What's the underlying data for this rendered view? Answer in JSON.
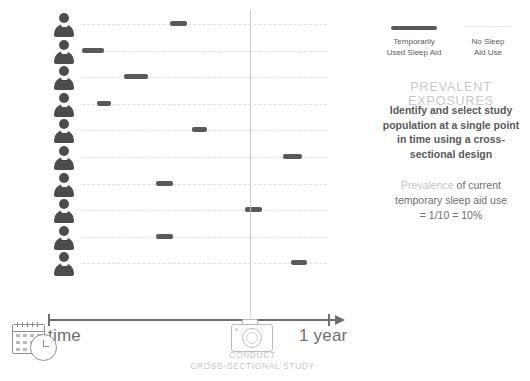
{
  "chart_data": {
    "type": "timeline",
    "xlabel": "time",
    "x_start_label": "time",
    "x_end_label": "1 year",
    "study_point_label_line1": "CONDUCT",
    "study_point_label_line2": "CROSS-SECTIONAL STUDY",
    "study_point_x_fraction": 0.73,
    "n_subjects": 10,
    "subjects": [
      {
        "id": 1,
        "icon": "person-icon",
        "exposure_start_fraction": 0.36,
        "exposure_end_fraction": 0.43,
        "crosses_study_point": false
      },
      {
        "id": 2,
        "icon": "person-icon",
        "exposure_start_fraction": 0.0,
        "exposure_end_fraction": 0.09,
        "crosses_study_point": false
      },
      {
        "id": 3,
        "icon": "person-icon",
        "exposure_start_fraction": 0.17,
        "exposure_end_fraction": 0.27,
        "crosses_study_point": false
      },
      {
        "id": 4,
        "icon": "person-icon",
        "exposure_start_fraction": 0.06,
        "exposure_end_fraction": 0.12,
        "crosses_study_point": false
      },
      {
        "id": 5,
        "icon": "person-icon",
        "exposure_start_fraction": 0.45,
        "exposure_end_fraction": 0.51,
        "crosses_study_point": false
      },
      {
        "id": 6,
        "icon": "person-icon",
        "exposure_start_fraction": 0.82,
        "exposure_end_fraction": 0.9,
        "crosses_study_point": false
      },
      {
        "id": 7,
        "icon": "person-icon",
        "exposure_start_fraction": 0.3,
        "exposure_end_fraction": 0.37,
        "crosses_study_point": false
      },
      {
        "id": 8,
        "icon": "person-icon",
        "exposure_start_fraction": 0.665,
        "exposure_end_fraction": 0.735,
        "crosses_study_point": true
      },
      {
        "id": 9,
        "icon": "person-icon",
        "exposure_start_fraction": 0.3,
        "exposure_end_fraction": 0.37,
        "crosses_study_point": false
      },
      {
        "id": 10,
        "icon": "person-icon",
        "exposure_start_fraction": 0.855,
        "exposure_end_fraction": 0.92,
        "crosses_study_point": false
      }
    ],
    "legend": [
      {
        "key": "exposed",
        "label_line1": "Temporarily",
        "label_line2": "Used Sleep Aid",
        "style": "solid",
        "color": "#58595b"
      },
      {
        "key": "unexposed",
        "label_line1": "No Sleep",
        "label_line2": "Aid Use",
        "style": "dashed",
        "color": "#e4e2e4"
      }
    ],
    "prevalence_numerator": 1,
    "prevalence_denominator": 10,
    "prevalence_percent": 10
  },
  "legend": {
    "items": [
      {
        "line1": "Temporarily",
        "line2": "Used Sleep Aid"
      },
      {
        "line1": "No Sleep",
        "line2": "Aid Use"
      }
    ]
  },
  "right_panel": {
    "title": "PREVALENT EXPOSURES",
    "description": "Identify and select study population at a single point in time using a cross-sectional design",
    "prevalence_lead": "Prevalence",
    "prevalence_rest": " of current temporary sleep aid use",
    "prevalence_value": "= 1/10 = 10%"
  },
  "axis": {
    "start_label": "time",
    "end_label": "1 year",
    "caption_line1": "CONDUCT",
    "caption_line2": "CROSS-SECTIONAL STUDY"
  },
  "icons": {
    "calendar_clock": "calendar-clock-icon",
    "camera": "camera-icon",
    "person": "person-icon"
  },
  "colors": {
    "exposed_bar": "#58595b",
    "unexposed_dash": "#e4e2e4",
    "person": "#4c4c4e",
    "study_line": "#c9c9cb",
    "axis": "#6d6e71",
    "title_gray": "#c8c9cb"
  }
}
